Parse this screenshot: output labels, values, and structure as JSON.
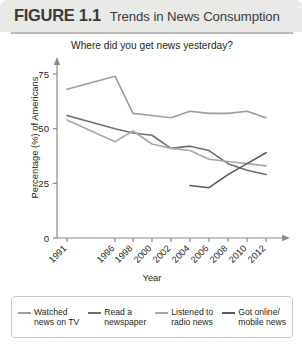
{
  "header": {
    "figure_number": "FIGURE 1.1",
    "figure_title": "Trends in News Consumption"
  },
  "chart_data": {
    "type": "line",
    "title": "Where did you get news yesterday?",
    "xlabel": "Year",
    "ylabel": "Percentage (%) of Americans",
    "ylim": [
      0,
      75
    ],
    "yticks": [
      0,
      25,
      50,
      75
    ],
    "grid": false,
    "legend_position": "bottom",
    "categories": [
      "1991",
      "1996",
      "1998",
      "2000",
      "2002",
      "2004",
      "2006",
      "2008",
      "2010",
      "2012"
    ],
    "series": [
      {
        "name": "Watched news on TV",
        "color": "#9d9d9d",
        "values": [
          68,
          74,
          57,
          56,
          55,
          58,
          57,
          57,
          58,
          55
        ]
      },
      {
        "name": "Read a newspaper",
        "color": "#6e6e6e",
        "values": [
          56,
          50,
          48,
          47,
          41,
          42,
          40,
          34,
          31,
          29
        ]
      },
      {
        "name": "Listened to radio news",
        "color": "#a8a8a8",
        "values": [
          54,
          44,
          49,
          43,
          41,
          40,
          36,
          35,
          34,
          33
        ]
      },
      {
        "name": "Got online/ mobile news",
        "color": "#5a5a5a",
        "values": [
          null,
          null,
          null,
          null,
          null,
          24,
          23,
          29,
          34,
          39
        ]
      }
    ]
  },
  "legend": {
    "items": [
      {
        "label": "Watched\nnews on TV",
        "color": "#9d9d9d"
      },
      {
        "label": "Read a\nnewspaper",
        "color": "#6e6e6e"
      },
      {
        "label": "Listened to\nradio news",
        "color": "#a8a8a8"
      },
      {
        "label": "Got online/\nmobile news",
        "color": "#5a5a5a"
      }
    ]
  }
}
